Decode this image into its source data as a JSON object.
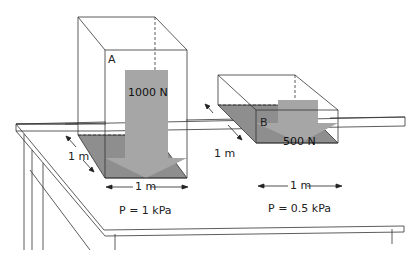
{
  "diagram": {
    "box_a": {
      "label": "A",
      "force": "1000 N",
      "depth": "1 m",
      "width": "1 m",
      "pressure": "P = 1 kPa"
    },
    "box_b": {
      "label": "B",
      "force": "500 N",
      "depth": "1 m",
      "width": "1 m",
      "pressure": "P = 0.5 kPa"
    },
    "colors": {
      "shadow": "#8e8e8e",
      "arrow": "#a6a6a6",
      "line": "#333333"
    }
  }
}
